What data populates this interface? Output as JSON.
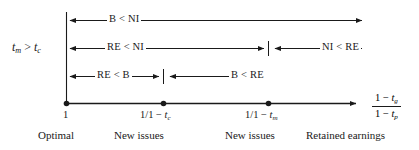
{
  "figure": {
    "type": "number-line-diagram",
    "condition_label": {
      "base": "t",
      "sub1": "m",
      "rel": " > ",
      "base2": "t",
      "sub2": "c",
      "text": "t_m > t_c"
    },
    "axis": {
      "origin_x": 66,
      "y": 103,
      "end_x": 360,
      "label": {
        "numerator_lead": "1 − ",
        "numerator_var": "t",
        "numerator_sub": "g",
        "denominator_lead": "1 − ",
        "denominator_var": "t",
        "denominator_sub": "p",
        "text": "(1 - t_g)/(1 - t_p)"
      },
      "ticks": [
        {
          "name": "origin",
          "x": 66,
          "label_text": "1",
          "label_lead": "1",
          "label_var": "",
          "label_sub": ""
        },
        {
          "name": "one-over-one-minus-tc",
          "x": 163,
          "label_text": "1/1 − t_c",
          "label_lead": "1/1 − ",
          "label_var": "t",
          "label_sub": "c"
        },
        {
          "name": "one-over-one-minus-tm",
          "x": 268,
          "label_text": "1/1 − t_m",
          "label_lead": "1/1 − ",
          "label_var": "t",
          "label_sub": "m"
        }
      ]
    },
    "rows": [
      {
        "name": "row-b-lt-ni",
        "y": 20,
        "segments": [
          {
            "name": "segment-b-lt-ni",
            "x1": 66,
            "x2": 366,
            "arrow_left": true,
            "arrow_right": true,
            "label": "B < NI",
            "label_x": 107,
            "tick_start": false,
            "tick_end": false
          }
        ]
      },
      {
        "name": "row-re-ni",
        "y": 48,
        "segments": [
          {
            "name": "segment-re-lt-ni",
            "x1": 66,
            "x2": 268,
            "arrow_left": true,
            "arrow_right": true,
            "label": "RE < NI",
            "label_x": 105,
            "tick_start": false,
            "tick_end": true
          },
          {
            "name": "segment-ni-lt-re",
            "x1": 271,
            "x2": 366,
            "arrow_left": true,
            "arrow_right": true,
            "label": "NI < RE",
            "label_x": 320,
            "tick_start": false,
            "tick_end": false
          }
        ]
      },
      {
        "name": "row-re-b",
        "y": 76,
        "segments": [
          {
            "name": "segment-re-lt-b",
            "x1": 66,
            "x2": 163,
            "arrow_left": true,
            "arrow_right": true,
            "label": "RE < B",
            "label_x": 95,
            "tick_start": false,
            "tick_end": true
          },
          {
            "name": "segment-b-lt-re",
            "x1": 166,
            "x2": 265,
            "arrow_left": true,
            "arrow_right": true,
            "label": "B < RE",
            "label_x": 229,
            "tick_start": false,
            "tick_end": false
          }
        ]
      }
    ],
    "zone_labels": [
      {
        "name": "zone-optimal",
        "text": "Optimal",
        "x": 38
      },
      {
        "name": "zone-new-issues-1",
        "text": "New issues",
        "x": 114
      },
      {
        "name": "zone-new-issues-2",
        "text": "New issues",
        "x": 225
      },
      {
        "name": "zone-retained-earnings",
        "text": "Retained earnings",
        "x": 306
      }
    ],
    "colors": {
      "ink": "#1a1a1a",
      "background": "#ffffff"
    }
  }
}
